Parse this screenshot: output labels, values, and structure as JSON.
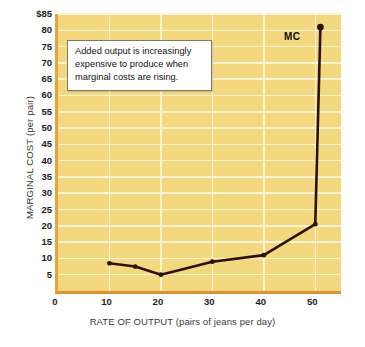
{
  "chart_data": {
    "type": "line",
    "title": "",
    "xlabel": "RATE OF OUTPUT (pairs of jeans per day)",
    "ylabel": "MARGINAL COST (per pair)",
    "xlim": [
      0,
      55
    ],
    "ylim": [
      0,
      85
    ],
    "grid": true,
    "legend_position": "inline-right",
    "x_ticks": [
      {
        "value": 0,
        "label": "0"
      },
      {
        "value": 10,
        "label": "10"
      },
      {
        "value": 20,
        "label": "20"
      },
      {
        "value": 30,
        "label": "30"
      },
      {
        "value": 40,
        "label": "40"
      },
      {
        "value": 50,
        "label": "50"
      }
    ],
    "x_gridlines": [
      10,
      20,
      30,
      40,
      50
    ],
    "y_ticks": [
      {
        "value": 85,
        "label": "$85"
      },
      {
        "value": 80,
        "label": "80"
      },
      {
        "value": 75,
        "label": "75"
      },
      {
        "value": 70,
        "label": "70"
      },
      {
        "value": 65,
        "label": "65"
      },
      {
        "value": 60,
        "label": "60"
      },
      {
        "value": 55,
        "label": "55"
      },
      {
        "value": 50,
        "label": "50"
      },
      {
        "value": 45,
        "label": "45"
      },
      {
        "value": 40,
        "label": "40"
      },
      {
        "value": 35,
        "label": "35"
      },
      {
        "value": 30,
        "label": "30"
      },
      {
        "value": 25,
        "label": "25"
      },
      {
        "value": 20,
        "label": "20"
      },
      {
        "value": 15,
        "label": "15"
      },
      {
        "value": 10,
        "label": "10"
      },
      {
        "value": 5,
        "label": "5"
      },
      {
        "value": 0,
        "label": ""
      }
    ],
    "series": [
      {
        "name": "MC",
        "label": "MC",
        "color": "#2b1205",
        "x": [
          10,
          15,
          20,
          30,
          40,
          50,
          51
        ],
        "values": [
          8.5,
          7.5,
          5,
          9,
          11,
          20.5,
          81
        ],
        "markers": [
          true,
          true,
          true,
          true,
          true,
          true,
          true
        ]
      }
    ],
    "annotations": [
      {
        "name": "callout",
        "lines": [
          "Added output is increasingly",
          "expensive to produce when",
          "marginal costs are rising."
        ]
      }
    ],
    "colors": {
      "plot_background": "#f3d87f",
      "gridline": "#fdf3d2",
      "axis_left": "#e8a33d",
      "axis_bottom": "#e0922e",
      "series_line": "#2b1205",
      "page_background": "#ffffff",
      "tick_text": "#1c1c1c",
      "axis_title_text": "#3a3a3a"
    }
  }
}
